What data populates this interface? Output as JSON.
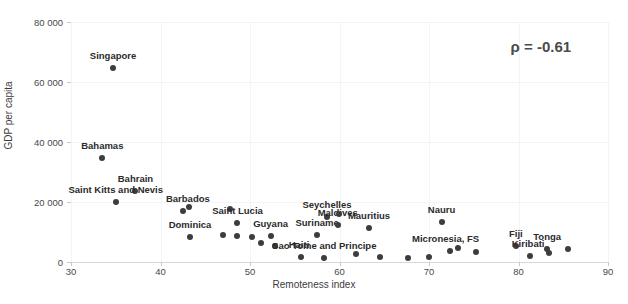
{
  "chart_data": {
    "type": "scatter",
    "title": "",
    "xlabel": "Remoteness index",
    "ylabel": "GDP per capita",
    "xlim": [
      30,
      90
    ],
    "ylim": [
      0,
      80000
    ],
    "xticks": [
      "30",
      "40",
      "50",
      "60",
      "70",
      "80",
      "90"
    ],
    "xtick_values": [
      30,
      40,
      50,
      60,
      70,
      80,
      90
    ],
    "yticks": [
      "0",
      "20 000",
      "40 000",
      "60 000",
      "80 000"
    ],
    "ytick_values": [
      0,
      20000,
      40000,
      60000,
      80000
    ],
    "grid": true,
    "legend": null,
    "annotations": [
      {
        "text": "ρ = -0.61",
        "x": 82.5,
        "y": 72000
      }
    ],
    "marker_color": "#3d3d3d",
    "points": [
      {
        "label": "Singapore",
        "x": 34.7,
        "y": 64700,
        "label_dx": 0,
        "label_dy": -7
      },
      {
        "label": "Bahamas",
        "x": 33.5,
        "y": 34800,
        "label_dx": 0,
        "label_dy": -7
      },
      {
        "label": "Bahrain",
        "x": 37.2,
        "y": 23800,
        "label_dx": 0,
        "label_dy": -7
      },
      {
        "label": "Saint Kitts and Nevis",
        "x": 35.0,
        "y": 20000,
        "label_dx": 0,
        "label_dy": -7
      },
      {
        "label": "Barbados",
        "x": 42.5,
        "y": 17000,
        "label_dx": 5,
        "label_dy": -7
      },
      {
        "label": "",
        "x": 43.2,
        "y": 18200,
        "label_dx": 0,
        "label_dy": 0
      },
      {
        "label": "Dominica",
        "x": 43.3,
        "y": 8400,
        "label_dx": 0,
        "label_dy": -7
      },
      {
        "label": "",
        "x": 47.0,
        "y": 8900,
        "label_dx": 0,
        "label_dy": 0
      },
      {
        "label": "",
        "x": 47.8,
        "y": 17800,
        "label_dx": 0,
        "label_dy": 0
      },
      {
        "label": "Saint Lucia",
        "x": 48.6,
        "y": 13000,
        "label_dx": 0,
        "label_dy": -7
      },
      {
        "label": "",
        "x": 48.6,
        "y": 8600,
        "label_dx": 0,
        "label_dy": 0
      },
      {
        "label": "",
        "x": 50.2,
        "y": 8300,
        "label_dx": 0,
        "label_dy": 0
      },
      {
        "label": "Guyana",
        "x": 52.3,
        "y": 8700,
        "label_dx": 0,
        "label_dy": -7
      },
      {
        "label": "",
        "x": 51.2,
        "y": 6300,
        "label_dx": 0,
        "label_dy": 0
      },
      {
        "label": "",
        "x": 52.8,
        "y": 5400,
        "label_dx": 0,
        "label_dy": 0
      },
      {
        "label": "Haiti",
        "x": 55.7,
        "y": 1600,
        "label_dx": -2,
        "label_dy": -7
      },
      {
        "label": "Suriname",
        "x": 57.5,
        "y": 9000,
        "label_dx": 0,
        "label_dy": -7
      },
      {
        "label": "Seychelles",
        "x": 58.6,
        "y": 15000,
        "label_dx": 0,
        "label_dy": -7
      },
      {
        "label": "Maldives",
        "x": 59.8,
        "y": 12300,
        "label_dx": 0,
        "label_dy": -7
      },
      {
        "label": "",
        "x": 59.9,
        "y": 15900,
        "label_dx": 0,
        "label_dy": 0
      },
      {
        "label": "Sao Tome and Principe",
        "x": 58.3,
        "y": 1500,
        "label_dx": 0,
        "label_dy": -7
      },
      {
        "label": "",
        "x": 61.8,
        "y": 2700,
        "label_dx": 0,
        "label_dy": 0
      },
      {
        "label": "Mauritius",
        "x": 63.3,
        "y": 11300,
        "label_dx": 0,
        "label_dy": -7
      },
      {
        "label": "",
        "x": 64.5,
        "y": 1800,
        "label_dx": 0,
        "label_dy": 0
      },
      {
        "label": "",
        "x": 67.6,
        "y": 1500,
        "label_dx": 0,
        "label_dy": 0
      },
      {
        "label": "Nauru",
        "x": 71.4,
        "y": 13500,
        "label_dx": 0,
        "label_dy": -7
      },
      {
        "label": "",
        "x": 70.0,
        "y": 1600,
        "label_dx": 0,
        "label_dy": 0
      },
      {
        "label": "Micronesia, FS",
        "x": 72.3,
        "y": 3600,
        "label_dx": -4,
        "label_dy": -7
      },
      {
        "label": "",
        "x": 73.2,
        "y": 4600,
        "label_dx": 0,
        "label_dy": 0
      },
      {
        "label": "",
        "x": 75.3,
        "y": 3300,
        "label_dx": 0,
        "label_dy": 0
      },
      {
        "label": "Fiji",
        "x": 79.7,
        "y": 5200,
        "label_dx": 0,
        "label_dy": -7
      },
      {
        "label": "Kiribati",
        "x": 81.3,
        "y": 1900,
        "label_dx": -2,
        "label_dy": -7
      },
      {
        "label": "Tonga",
        "x": 83.2,
        "y": 4500,
        "label_dx": 0,
        "label_dy": -7
      },
      {
        "label": "",
        "x": 83.4,
        "y": 2900,
        "label_dx": 0,
        "label_dy": 0
      },
      {
        "label": "",
        "x": 85.5,
        "y": 4300,
        "label_dx": 0,
        "label_dy": 0
      }
    ]
  }
}
